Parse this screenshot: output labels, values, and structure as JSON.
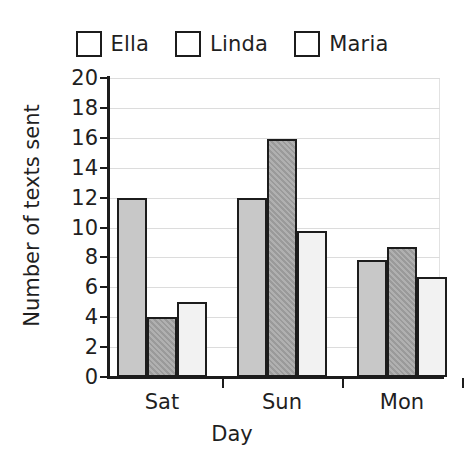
{
  "chart_data": {
    "type": "bar",
    "title": "",
    "subtitle": "",
    "xlabel": "Day",
    "ylabel": "Number of texts sent",
    "categories": [
      "Sat",
      "Sun",
      "Mon"
    ],
    "series": [
      {
        "name": "Ella",
        "color": "#c8c8c8",
        "values": [
          12,
          12,
          7.8
        ]
      },
      {
        "name": "Linda",
        "color": "#9a9a9a",
        "values": [
          4,
          15.9,
          8.7
        ]
      },
      {
        "name": "Maria",
        "color": "#f2f2f2",
        "values": [
          5,
          9.8,
          6.7
        ]
      }
    ],
    "ylim": [
      0,
      20
    ],
    "ytick_step": 2,
    "yticks": [
      0,
      2,
      4,
      6,
      8,
      10,
      12,
      14,
      16,
      18,
      20
    ],
    "ytick_labels": [
      "0",
      "2",
      "4",
      "6",
      "8",
      "10",
      "12",
      "14",
      "16",
      "18",
      "20"
    ],
    "grid": true,
    "grid_axis": "y",
    "grid_color": "#dcdcdc",
    "legend_position": "top",
    "bar_border_color": "#1c1c1c",
    "group_gap": true
  },
  "legend": {
    "items": [
      {
        "label": "Ella",
        "swatch_name": "legend-swatch-ella"
      },
      {
        "label": "Linda",
        "swatch_name": "legend-swatch-linda"
      },
      {
        "label": "Maria",
        "swatch_name": "legend-swatch-maria"
      }
    ]
  }
}
